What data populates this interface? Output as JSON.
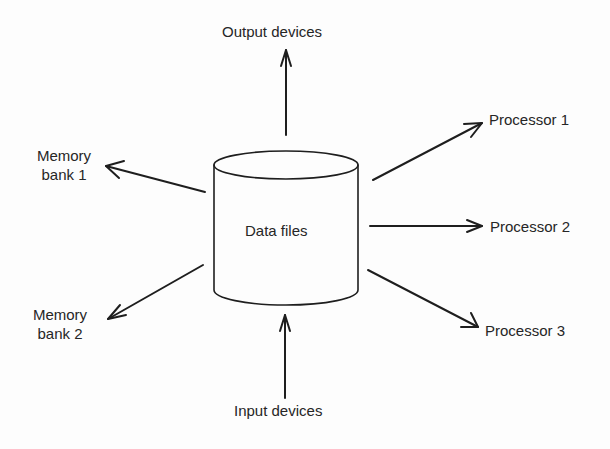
{
  "diagram": {
    "center_node": {
      "label": "Data files",
      "shape": "cylinder"
    },
    "nodes": {
      "output": {
        "label": "Output devices"
      },
      "input": {
        "label": "Input devices"
      },
      "memory1": {
        "line1": "Memory",
        "line2": "bank 1"
      },
      "memory2": {
        "line1": "Memory",
        "line2": "bank 2"
      },
      "processor1": {
        "label": "Processor 1"
      },
      "processor2": {
        "label": "Processor 2"
      },
      "processor3": {
        "label": "Processor 3"
      }
    },
    "edges": [
      {
        "from": "Data files",
        "to": "Output devices"
      },
      {
        "from": "Input devices",
        "to": "Data files"
      },
      {
        "from": "Data files",
        "to": "Memory bank 1"
      },
      {
        "from": "Data files",
        "to": "Memory bank 2"
      },
      {
        "from": "Data files",
        "to": "Processor 1"
      },
      {
        "from": "Data files",
        "to": "Processor 2"
      },
      {
        "from": "Data files",
        "to": "Processor 3"
      }
    ],
    "colors": {
      "line": "#1e1e1e",
      "text": "#262626",
      "background": "#fdfdfd"
    }
  }
}
